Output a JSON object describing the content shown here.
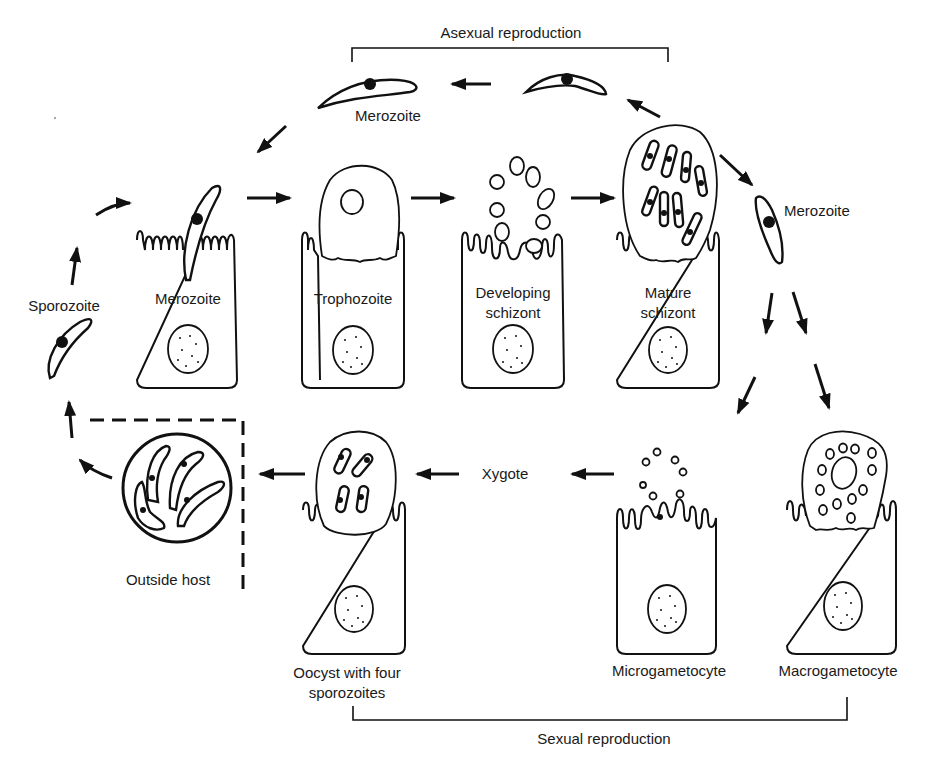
{
  "diagram": {
    "type": "life-cycle",
    "brackets": {
      "top": "Asexual reproduction",
      "bottom": "Sexual reproduction"
    },
    "labels": {
      "merozoite_top": "Merozoite",
      "merozoite_right": "Merozoite",
      "sporozoite": "Sporozoite",
      "xygote": "Xygote",
      "outside_host": "Outside host"
    },
    "cells": [
      {
        "id": "merozoite",
        "label_lines": [
          "Merozoite"
        ]
      },
      {
        "id": "trophozoite",
        "label_lines": [
          "Trophozoite"
        ]
      },
      {
        "id": "developing-schizont",
        "label_lines": [
          "Developing",
          "schizont"
        ]
      },
      {
        "id": "mature-schizont",
        "label_lines": [
          "Mature",
          "schizont"
        ]
      },
      {
        "id": "oocyst",
        "label_lines": [
          "Oocyst with four",
          "sporozoites"
        ]
      },
      {
        "id": "microgametocyte",
        "label_lines": [
          "Microgametocyte"
        ]
      },
      {
        "id": "macrogametocyte",
        "label_lines": [
          "Macrogametocyte"
        ]
      }
    ],
    "stroke_color": "#111111",
    "background": "#ffffff"
  }
}
